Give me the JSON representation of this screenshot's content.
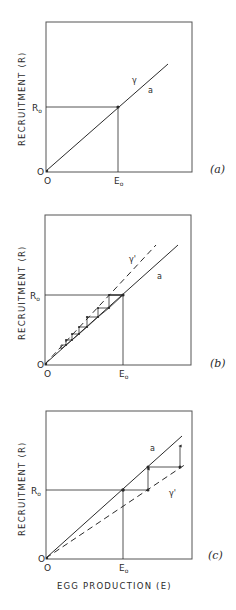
{
  "figure": {
    "panels": [
      {
        "id": "a",
        "label": "(a)",
        "ylabel": "RECRUITMENT (R)",
        "origin_y_label": "O",
        "origin_x_label": "O",
        "r0_label": "R",
        "r0_sub": "o",
        "e0_label": "E",
        "e0_sub": "o",
        "curve_labels": {
          "gamma": "γ",
          "a": "a"
        }
      },
      {
        "id": "b",
        "label": "(b)",
        "ylabel": "RECRUITMENT (R)",
        "origin_y_label": "O",
        "origin_x_label": "O",
        "r0_label": "R",
        "r0_sub": "o",
        "e0_label": "E",
        "e0_sub": "o",
        "curve_labels": {
          "gamma": "γ'",
          "a": "a"
        }
      },
      {
        "id": "c",
        "label": "(c)",
        "ylabel": "RECRUITMENT (R)",
        "xlabel": "EGG PRODUCTION (E)",
        "origin_y_label": "O",
        "origin_x_label": "O",
        "r0_label": "R",
        "r0_sub": "o",
        "e0_label": "E",
        "e0_sub": "o",
        "curve_labels": {
          "gamma": "γ'",
          "a": "a"
        }
      }
    ]
  },
  "colors": {
    "ink": "#2a2a2a",
    "frame": "#555555",
    "background": "#ffffff"
  }
}
